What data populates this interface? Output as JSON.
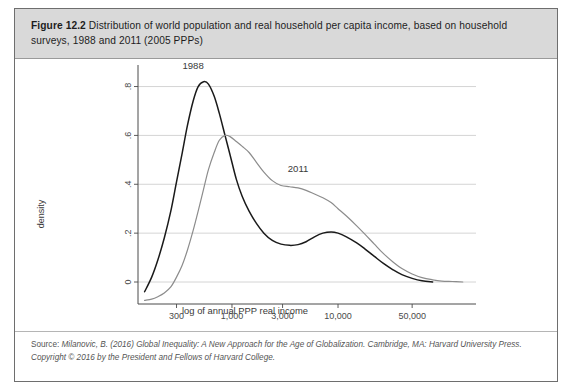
{
  "figure": {
    "label": "Figure 12.2",
    "caption": "Distribution of world population and real household per capita income, based on household surveys, 1988 and 2011 (2005 PPPs)"
  },
  "source": {
    "prefix": "Source:",
    "text": "Milanovic, B. (2016) Global Inequality: A New Approach for the Age of Globalization. Cambridge, MA: Harvard University Press. Copyright © 2016 by the President and Fellows of Harvard College."
  },
  "colors": {
    "series_1988": "#1a1a1a",
    "series_2011": "#8c8c8c",
    "grid": "#c9c9c9",
    "axis": "#4a4a4a",
    "caption_band": "#d9d9d9",
    "border": "#6e6e6e"
  },
  "chart_data": {
    "type": "line",
    "title": "",
    "xlabel": "log of annual PPP real income",
    "ylabel": "density",
    "grid": true,
    "legend": "inline-annotations",
    "xscale": "log",
    "xtick_labels": [
      "300",
      "1,000",
      "3,000",
      "10,000",
      "50,000"
    ],
    "xtick_values": [
      300,
      1000,
      3000,
      10000,
      50000
    ],
    "ytick_labels": [
      "0",
      ".2",
      ".4",
      ".6",
      ".8"
    ],
    "ytick_values": [
      0,
      0.2,
      0.4,
      0.6,
      0.8
    ],
    "ylim": [
      -0.09,
      0.88
    ],
    "xlim": [
      130,
      200000
    ],
    "annotations": [
      {
        "text": "1988",
        "x": 430,
        "y": 0.87
      },
      {
        "text": "2011",
        "x": 4200,
        "y": 0.45
      }
    ],
    "series": [
      {
        "name": "1988",
        "color": "#1a1a1a",
        "x": [
          150,
          175,
          200,
          230,
          265,
          300,
          340,
          380,
          430,
          480,
          540,
          600,
          680,
          760,
          860,
          960,
          1100,
          1250,
          1450,
          1700,
          2000,
          2400,
          2900,
          3500,
          4200,
          5000,
          6000,
          7200,
          8600,
          10000,
          12000,
          15000,
          18000,
          22000,
          27000,
          33000,
          40000,
          50000,
          62000,
          78000
        ],
        "y": [
          -0.04,
          0.02,
          0.09,
          0.18,
          0.29,
          0.41,
          0.53,
          0.64,
          0.74,
          0.8,
          0.82,
          0.81,
          0.76,
          0.69,
          0.6,
          0.52,
          0.42,
          0.35,
          0.29,
          0.24,
          0.2,
          0.17,
          0.155,
          0.15,
          0.153,
          0.165,
          0.185,
          0.2,
          0.205,
          0.2,
          0.185,
          0.16,
          0.135,
          0.105,
          0.075,
          0.05,
          0.03,
          0.015,
          0.005,
          0.0
        ]
      },
      {
        "name": "2011",
        "color": "#8c8c8c",
        "x": [
          150,
          175,
          200,
          230,
          265,
          300,
          340,
          380,
          430,
          480,
          540,
          600,
          680,
          760,
          860,
          960,
          1100,
          1250,
          1450,
          1700,
          2000,
          2400,
          2900,
          3500,
          4200,
          5000,
          6000,
          7200,
          8600,
          10000,
          12000,
          15000,
          18000,
          22000,
          27000,
          33000,
          40000,
          50000,
          62000,
          78000,
          95000,
          120000,
          150000
        ],
        "y": [
          -0.075,
          -0.07,
          -0.06,
          -0.045,
          -0.02,
          0.02,
          0.07,
          0.13,
          0.21,
          0.29,
          0.38,
          0.46,
          0.53,
          0.58,
          0.6,
          0.595,
          0.575,
          0.555,
          0.53,
          0.49,
          0.45,
          0.415,
          0.395,
          0.39,
          0.385,
          0.375,
          0.36,
          0.345,
          0.325,
          0.3,
          0.27,
          0.23,
          0.195,
          0.155,
          0.115,
          0.082,
          0.055,
          0.033,
          0.018,
          0.009,
          0.004,
          0.002,
          0.0
        ]
      }
    ]
  }
}
